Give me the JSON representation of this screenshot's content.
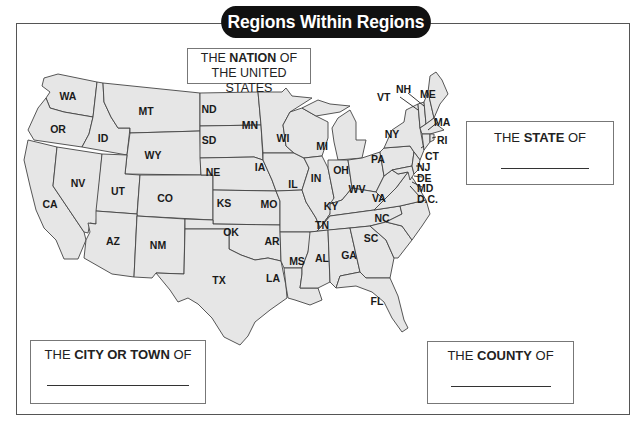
{
  "title": "Regions Within Regions",
  "boxes": {
    "nation": {
      "prefix": "THE ",
      "bold": "NATION",
      "suffix": " OF",
      "line2": "THE UNITED STATES"
    },
    "state": {
      "prefix": "THE ",
      "bold": "STATE",
      "suffix": " OF"
    },
    "city": {
      "prefix": "THE ",
      "bold": "CITY OR TOWN",
      "suffix": " OF"
    },
    "county": {
      "prefix": "THE ",
      "bold": "COUNTY",
      "suffix": " OF"
    }
  },
  "colors": {
    "state_fill": "#e6e6e6",
    "border": "#444444",
    "title_bg": "#111111",
    "title_text": "#ffffff"
  },
  "states": {
    "WA": "WA",
    "OR": "OR",
    "CA": "CA",
    "ID": "ID",
    "NV": "NV",
    "MT": "MT",
    "WY": "WY",
    "UT": "UT",
    "AZ": "AZ",
    "CO": "CO",
    "NM": "NM",
    "ND": "ND",
    "SD": "SD",
    "NE": "NE",
    "KS": "KS",
    "OK": "OK",
    "TX": "TX",
    "MN": "MN",
    "IA": "IA",
    "MO": "MO",
    "AR": "AR",
    "LA": "LA",
    "WI": "WI",
    "IL": "IL",
    "MI": "MI",
    "IN": "IN",
    "OH": "OH",
    "KY": "KY",
    "TN": "TN",
    "MS": "MS",
    "AL": "AL",
    "GA": "GA",
    "FL": "FL",
    "SC": "SC",
    "NC": "NC",
    "VA": "VA",
    "WV": "WV",
    "PA": "PA",
    "NY": "NY",
    "VT": "VT",
    "NH": "NH",
    "ME": "ME",
    "MA": "MA",
    "RI": "RI",
    "CT": "CT",
    "NJ": "NJ",
    "DE": "DE",
    "MD": "MD",
    "DC": "D.C."
  }
}
